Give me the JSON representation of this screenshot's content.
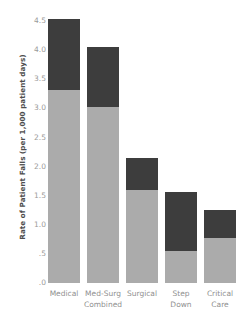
{
  "chart_data": {
    "type": "bar",
    "stacked": true,
    "title": "",
    "xlabel": "",
    "ylabel": "Rate of Patient Falls (per 1,000 patient days)",
    "categories": [
      "Medical",
      "Med-Surg Combined",
      "Surgical",
      "Step Down",
      "Critical Care"
    ],
    "category_lines": [
      [
        "Medical",
        ""
      ],
      [
        "Med-Surg",
        "Combined"
      ],
      [
        "Surgical",
        ""
      ],
      [
        "Step",
        "Down"
      ],
      [
        "Critical",
        "Care"
      ]
    ],
    "series": [
      {
        "name": "lower-segment",
        "color": "#ababab",
        "values": [
          3.32,
          3.02,
          1.6,
          0.55,
          0.77
        ]
      },
      {
        "name": "upper-segment",
        "color": "#3d3d3d",
        "values": [
          1.22,
          1.04,
          0.55,
          1.01,
          0.48
        ]
      }
    ],
    "totals": [
      4.54,
      4.06,
      2.15,
      1.56,
      1.25
    ],
    "ylim": [
      0,
      4.75
    ],
    "yticks": [
      4.5,
      4.0,
      3.5,
      3.0,
      2.5,
      2.0,
      1.5,
      1.0,
      0.5,
      0.0
    ],
    "ytick_labels": [
      "4.5",
      "4.0",
      "3.5",
      "3.0",
      "2.5",
      "2.0",
      "1.5",
      "1.0",
      ".5",
      ".0"
    ],
    "grid": false,
    "legend": "none",
    "colors": {
      "lower": "#ababab",
      "upper": "#3d3d3d",
      "tick_text": "#9a9a9a",
      "axis_title": "#4d4d4d",
      "background": "#ffffff"
    }
  }
}
